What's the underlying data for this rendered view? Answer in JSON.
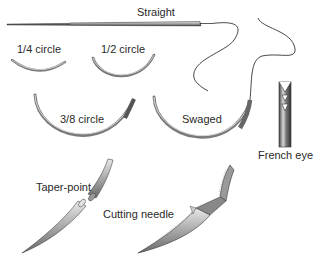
{
  "diagram": {
    "labels": {
      "straight": "Straight",
      "quarter_circle": "1/4 circle",
      "half_circle": "1/2 circle",
      "three_eighths_circle": "3/8 circle",
      "swaged": "Swaged",
      "french_eye": "French eye",
      "taper_point": "Taper-point",
      "cutting_needle": "Cutting needle"
    },
    "colors": {
      "background": "#ffffff",
      "line": "#3a3a3a",
      "needle_fill": "#b8b8b8",
      "needle_dark": "#555555",
      "text": "#2a2a2a"
    }
  }
}
